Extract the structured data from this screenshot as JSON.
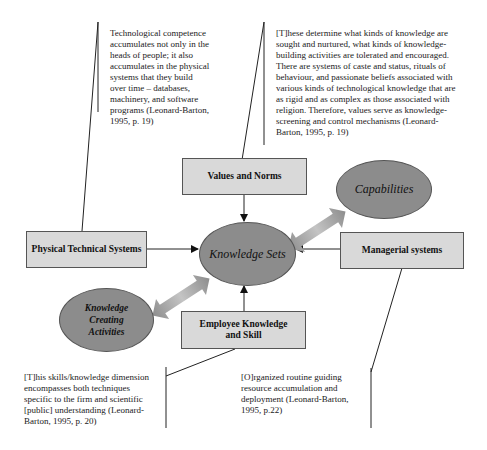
{
  "quotes": {
    "physical": "Technological competence accumulates not only in the heads of people; it also accumulates in the physical systems that they build over time – databases, machinery, and software programs (Leonard-Barton, 1995, p. 19)",
    "values": "[T]hese determine what kinds of knowledge are sought and nurtured, what kinds of knowledge-building activities are tolerated and encouraged. There are systems of caste and status, rituals of behaviour, and passionate beliefs associated with various kinds of technological knowledge that are as rigid and as complex as those associated with religion. Therefore, values serve as knowledge-screening and control mechanisms (Leonard-Barton, 1995, p. 19)",
    "employee": "[T]his skills/knowledge dimension encompasses both techniques specific to the firm and scientific [public] understanding (Leonard-Barton, 1995, p. 20)",
    "managerial": "[O]rganized routine guiding resource accumulation and deployment (Leonard-Barton, 1995, p.22)"
  },
  "boxes": {
    "values_norms": "Values and Norms",
    "physical_systems": "Physical Technical Systems",
    "managerial_systems": "Managerial systems",
    "employee_knowledge": "Employee Knowledge and Skill"
  },
  "ellipses": {
    "knowledge_sets": "Knowledge Sets",
    "capabilities": "Capabilities",
    "knowledge_creating": "Knowledge Creating Activities"
  },
  "colors": {
    "box_fill": "#d9d9d9",
    "ellipse_fill": "#8c8c8c",
    "arrow_fill": "#a9a9a9"
  }
}
